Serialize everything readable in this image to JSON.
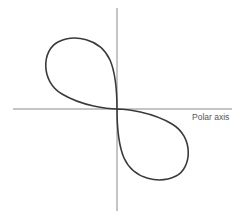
{
  "diagram": {
    "type": "polar-curve",
    "labels": {
      "polar_axis": "Polar axis"
    },
    "colors": {
      "curve": "#3a3a3a",
      "axis": "#8a8a8a",
      "label": "#555555",
      "background": "#ffffff"
    },
    "origin": {
      "x": 117,
      "y": 109
    },
    "extents": {
      "upper_left_lobe": {
        "left": 46,
        "top": 38
      },
      "lower_right_lobe": {
        "right": 189,
        "bottom": 178
      }
    }
  }
}
